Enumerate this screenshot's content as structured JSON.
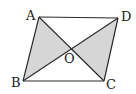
{
  "figure": {
    "colors": {
      "stroke": "#2a2a2a",
      "shade": "#d6d6d6",
      "background": "#ffffff"
    },
    "points": {
      "A": {
        "label": "A",
        "x": 39,
        "y": 17,
        "label_x": 26,
        "label_y": 20
      },
      "D": {
        "label": "D",
        "x": 118,
        "y": 18,
        "label_x": 121,
        "label_y": 21
      },
      "B": {
        "label": "B",
        "x": 23,
        "y": 81,
        "label_x": 11,
        "label_y": 87
      },
      "C": {
        "label": "C",
        "x": 104,
        "y": 81,
        "label_x": 106,
        "label_y": 89
      },
      "O": {
        "label": "O",
        "x": 70.5,
        "y": 49.5,
        "label_x": 64,
        "label_y": 63
      }
    },
    "shaded_triangles": [
      "AOB",
      "COD"
    ],
    "segments": [
      "AD",
      "DC",
      "CB",
      "BA",
      "AC",
      "BD"
    ]
  }
}
